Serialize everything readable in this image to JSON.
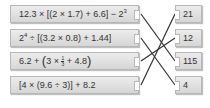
{
  "expressions": [
    {
      "id": "e1",
      "parts": {
        "a": "12.3 × [(2 × 1.7) + 6.6] − 2",
        "sup": "3"
      },
      "top": 5
    },
    {
      "id": "e2",
      "parts": {
        "a": "2",
        "sup": "4",
        "b": " ÷ [(3.2 × 0.8) + 1.44]"
      },
      "top": 29
    },
    {
      "id": "e3",
      "parts": {
        "a": "6.2 + ",
        "p1": "(",
        "b": "3 × ",
        "num": "1",
        "den": "3",
        "c": " + 4.8",
        "p2": ")"
      },
      "top": 52
    },
    {
      "id": "e4",
      "parts": {
        "a": "[4 × (9.6 ÷ 3)] + 8.2"
      },
      "top": 76
    }
  ],
  "answers": [
    {
      "id": "a1",
      "label": "21",
      "top": 5
    },
    {
      "id": "a2",
      "label": "12",
      "top": 29
    },
    {
      "id": "a3",
      "label": "115",
      "top": 52
    },
    {
      "id": "a4",
      "label": "4",
      "top": 76
    }
  ],
  "connections": [
    {
      "from": "e1",
      "to": "a3"
    },
    {
      "from": "e2",
      "to": "a4"
    },
    {
      "from": "e3",
      "to": "a2"
    },
    {
      "from": "e4",
      "to": "a1"
    }
  ],
  "colors": {
    "line": "#333333",
    "box_border": "#b8b8b8",
    "text": "#333333"
  }
}
